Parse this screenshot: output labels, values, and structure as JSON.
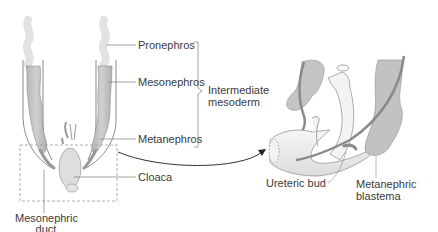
{
  "diagram": {
    "labels": {
      "pronephros": "Pronephros",
      "mesonephros": "Mesonephros",
      "metanephros": "Metanephros",
      "intermediate_mesoderm_1": "Intermediate",
      "intermediate_mesoderm_2": "mesoderm",
      "cloaca": "Cloaca",
      "mesonephric_duct_1": "Mesonephric",
      "mesonephric_duct_2": "duct",
      "ureteric_bud": "Ureteric bud",
      "metanephric_blastema_1": "Metanephric",
      "metanephric_blastema_2": "blastema"
    },
    "colors": {
      "tissue_fill": "#c9c9c9",
      "tissue_dark": "#a8a8a8",
      "outline": "#7a7a7a",
      "duct_fill": "#efefef",
      "label_text": "#3a3a3a",
      "leader_line": "#8a8a8a"
    }
  }
}
